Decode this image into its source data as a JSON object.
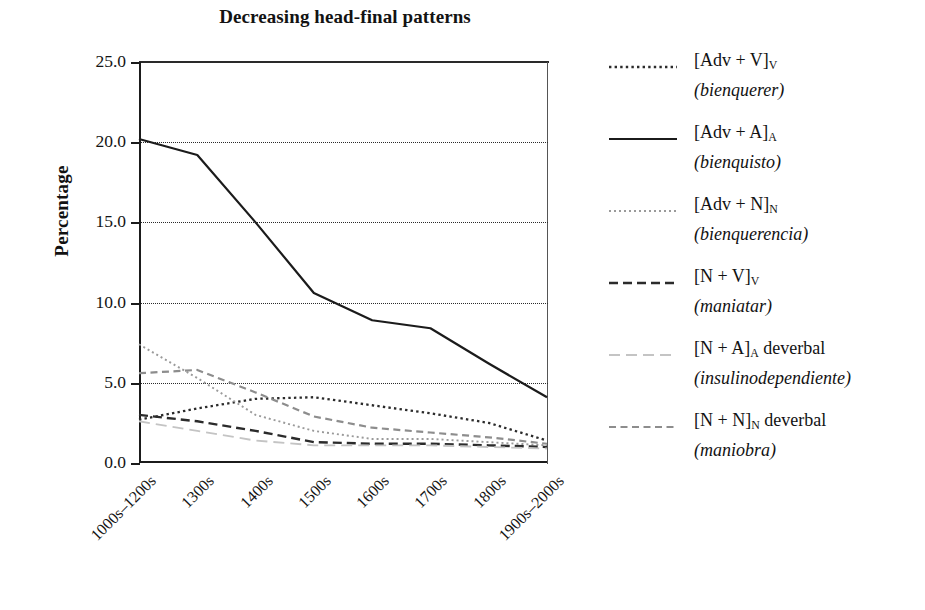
{
  "chart_data": {
    "type": "line",
    "title": "Decreasing head-final patterns",
    "xlabel": "",
    "ylabel": "Percentage",
    "ylim": [
      0.0,
      25.0
    ],
    "yticks": [
      "0.0",
      "5.0",
      "10.0",
      "15.0",
      "20.0",
      "25.0"
    ],
    "ytick_values": [
      0.0,
      5.0,
      10.0,
      15.0,
      20.0,
      25.0
    ],
    "grid": "horizontal-dotted",
    "legend_position": "right",
    "categories": [
      "1000s–1200s",
      "1300s",
      "1400s",
      "1500s",
      "1600s",
      "1700s",
      "1800s",
      "1900s–2000s"
    ],
    "series": [
      {
        "name": "[Adv + V]V",
        "label_main": "[Adv + V]",
        "label_sub": "V",
        "label_example": "(bienquerer)",
        "style": "dotted",
        "color": "#2b2b2b",
        "values": [
          2.7,
          3.4,
          4.0,
          4.1,
          3.6,
          3.1,
          2.5,
          1.4
        ]
      },
      {
        "name": "[Adv + A]A",
        "label_main": "[Adv + A]",
        "label_sub": "A",
        "label_example": "(bienquisto)",
        "style": "solid",
        "color": "#1b1b1b",
        "values": [
          20.2,
          19.2,
          15.0,
          10.6,
          8.9,
          8.4,
          6.2,
          4.1
        ]
      },
      {
        "name": "[Adv + N]N",
        "label_main": "[Adv + N]",
        "label_sub": "N",
        "label_example": "(bienquerencia)",
        "style": "fine-dotted",
        "color": "#9a9a9a",
        "values": [
          7.4,
          5.3,
          3.0,
          2.0,
          1.5,
          1.5,
          1.3,
          1.1
        ]
      },
      {
        "name": "[N + V]V",
        "label_main": "[N + V]",
        "label_sub": "V",
        "label_example": "(maniatar)",
        "style": "dashed",
        "color": "#2b2b2b",
        "values": [
          3.0,
          2.6,
          2.0,
          1.3,
          1.2,
          1.2,
          1.1,
          1.0
        ]
      },
      {
        "name": "[N + A]A deverbal",
        "label_main": "[N + A]",
        "label_sub": "A",
        "label_suffix": " deverbal",
        "label_example": "(insulinodependiente)",
        "style": "light-longdash",
        "color": "#c4c4c4",
        "values": [
          2.6,
          2.0,
          1.4,
          1.1,
          1.1,
          1.1,
          1.0,
          0.9
        ]
      },
      {
        "name": "[N + N]N deverbal",
        "label_main": "[N + N]",
        "label_sub": "N",
        "label_suffix": " deverbal",
        "label_example": "(maniobra)",
        "style": "med-dashed",
        "color": "#8d8d8d",
        "values": [
          5.6,
          5.8,
          4.4,
          2.9,
          2.2,
          1.9,
          1.6,
          1.2
        ]
      }
    ]
  },
  "axes": {
    "y_title": "Percentage",
    "y_ticks": [
      "25.0",
      "20.0",
      "15.0",
      "10.0",
      "5.0",
      "0.0"
    ],
    "x_ticks": [
      "1000s–1200s",
      "1300s",
      "1400s",
      "1500s",
      "1600s",
      "1700s",
      "1800s",
      "1900s–2000s"
    ]
  },
  "legend": {
    "items": [
      {
        "main": "[Adv + V]",
        "sub": "V",
        "suffix": "",
        "example": "(bienquerer)"
      },
      {
        "main": "[Adv + A]",
        "sub": "A",
        "suffix": "",
        "example": "(bienquisto)"
      },
      {
        "main": "[Adv + N]",
        "sub": "N",
        "suffix": "",
        "example": "(bienquerencia)"
      },
      {
        "main": "[N + V]",
        "sub": "V",
        "suffix": "",
        "example": "(maniatar)"
      },
      {
        "main": "[N + A]",
        "sub": "A",
        "suffix": " deverbal",
        "example": "(insulinodependiente)"
      },
      {
        "main": "[N + N]",
        "sub": "N",
        "suffix": " deverbal",
        "example": "(maniobra)"
      }
    ]
  }
}
